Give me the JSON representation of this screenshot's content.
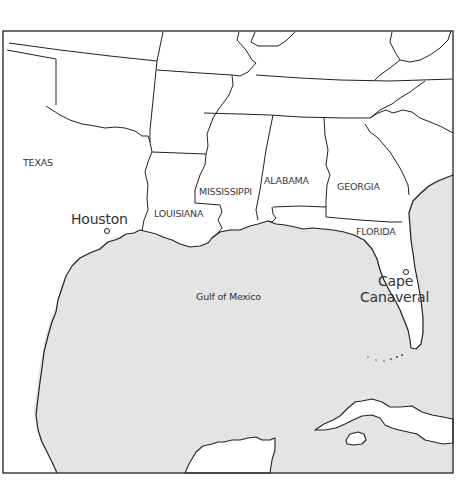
{
  "map": {
    "colors": {
      "land": "#ffffff",
      "water": "#e4e4e4",
      "border": "#222222"
    },
    "states": [
      {
        "id": "texas",
        "label": "TEXAS"
      },
      {
        "id": "louisiana",
        "label": "LOUISIANA"
      },
      {
        "id": "mississippi",
        "label": "MISSISSIPPI"
      },
      {
        "id": "alabama",
        "label": "ALABAMA"
      },
      {
        "id": "georgia",
        "label": "GEORGIA"
      },
      {
        "id": "florida",
        "label": "FLORIDA"
      }
    ],
    "cities": [
      {
        "id": "houston",
        "label": "Houston"
      },
      {
        "id": "cape-canaveral",
        "label_line1": "Cape",
        "label_line2": "Canaveral"
      }
    ],
    "water_bodies": [
      {
        "id": "gulf-of-mexico",
        "label": "Gulf of Mexico"
      }
    ]
  }
}
